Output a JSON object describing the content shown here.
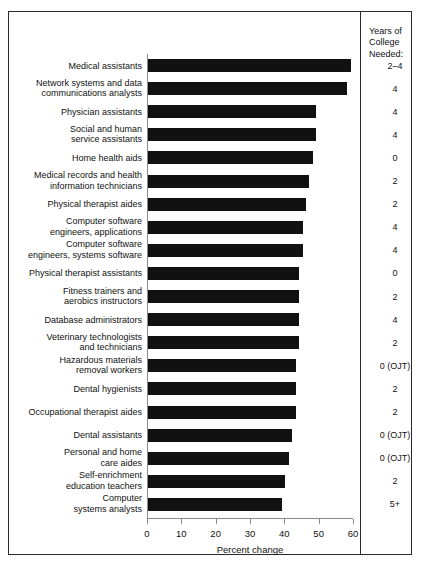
{
  "years_column": {
    "header": "Years of\nCollege\nNeeded:"
  },
  "chart_data": {
    "type": "bar",
    "orientation": "horizontal",
    "title": "",
    "xlabel": "Percent change",
    "ylabel": "",
    "xlim": [
      0,
      60
    ],
    "xticks": [
      0,
      10,
      20,
      30,
      40,
      50,
      60
    ],
    "grid": false,
    "legend": false,
    "bar_color": "#111111",
    "categories": [
      "Medical assistants",
      "Network systems and data\ncommunications analysts",
      "Physician assistants",
      "Social and human\nservice assistants",
      "Home health aids",
      "Medical records and health\ninformation technicians",
      "Physical therapist aides",
      "Computer software\nengineers, applications",
      "Computer software\nengineers, systems software",
      "Physical therapist assistants",
      "Fitness trainers and\naerobics instructors",
      "Database administrators",
      "Veterinary technologists\nand technicians",
      "Hazardous materials\nremoval workers",
      "Dental hygienists",
      "Occupational therapist aides",
      "Dental assistants",
      "Personal and home\ncare aides",
      "Self-enrichment\neducation teachers",
      "Computer\nsystems analysts"
    ],
    "values": [
      59,
      58,
      49,
      49,
      48,
      47,
      46,
      45,
      45,
      44,
      44,
      44,
      44,
      43,
      43,
      43,
      42,
      41,
      40,
      39
    ],
    "years_of_college": [
      "2–4",
      "4",
      "4",
      "4",
      "0",
      "2",
      "2",
      "4",
      "4",
      "0",
      "2",
      "4",
      "2",
      "0 (OJT)",
      "2",
      "2",
      "0 (OJT)",
      "0 (OJT)",
      "2",
      "5+"
    ]
  }
}
